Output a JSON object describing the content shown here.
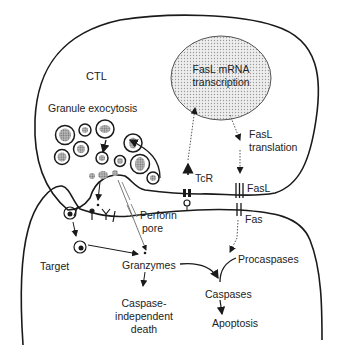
{
  "diagram": {
    "cells": {
      "effector": "CTL",
      "target": "Target"
    },
    "nucleus": {
      "line1": "FasL mRNA",
      "line2": "transcription"
    },
    "labels": {
      "granule_exocytosis": "Granule exocytosis",
      "fasl_translation_1": "FasL",
      "fasl_translation_2": "translation",
      "tcr": "TcR",
      "fasl": "FasL",
      "fas": "Fas",
      "perforin_1": "Perforin",
      "perforin_2": "pore",
      "granzymes": "Granzymes",
      "procaspases": "Procaspases",
      "caspases": "Caspases",
      "apoptosis": "Apoptosis",
      "caspase_indep_1": "Caspase-",
      "caspase_indep_2": "independent",
      "caspase_indep_3": "death"
    },
    "colors": {
      "line": "#1a1a1a",
      "granule_fill": "#9a9a9a",
      "nucleus_fill": "#e4e4e4"
    }
  }
}
